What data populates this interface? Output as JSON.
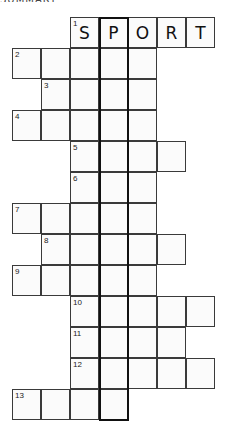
{
  "header": {
    "cut_text": "SUMMARY"
  },
  "puzzle": {
    "origin": {
      "x": 12,
      "y": 17
    },
    "cell_w": 29,
    "cell_h": 31,
    "highlight_column": 3,
    "highlight_rows": 13,
    "rows": [
      {
        "clue": "1",
        "start_col": 2,
        "length": 5,
        "letters": [
          "S",
          "P",
          "O",
          "R",
          "T"
        ]
      },
      {
        "clue": "2",
        "start_col": 0,
        "length": 5,
        "letters": []
      },
      {
        "clue": "3",
        "start_col": 1,
        "length": 4,
        "letters": []
      },
      {
        "clue": "4",
        "start_col": 0,
        "length": 5,
        "letters": []
      },
      {
        "clue": "5",
        "start_col": 2,
        "length": 4,
        "letters": []
      },
      {
        "clue": "6",
        "start_col": 2,
        "length": 3,
        "letters": []
      },
      {
        "clue": "7",
        "start_col": 0,
        "length": 5,
        "letters": []
      },
      {
        "clue": "8",
        "start_col": 1,
        "length": 5,
        "letters": []
      },
      {
        "clue": "9",
        "start_col": 0,
        "length": 5,
        "letters": []
      },
      {
        "clue": "10",
        "start_col": 2,
        "length": 5,
        "letters": []
      },
      {
        "clue": "11",
        "start_col": 2,
        "length": 4,
        "letters": []
      },
      {
        "clue": "12",
        "start_col": 2,
        "length": 5,
        "letters": []
      },
      {
        "clue": "13",
        "start_col": 0,
        "length": 4,
        "letters": []
      }
    ]
  }
}
